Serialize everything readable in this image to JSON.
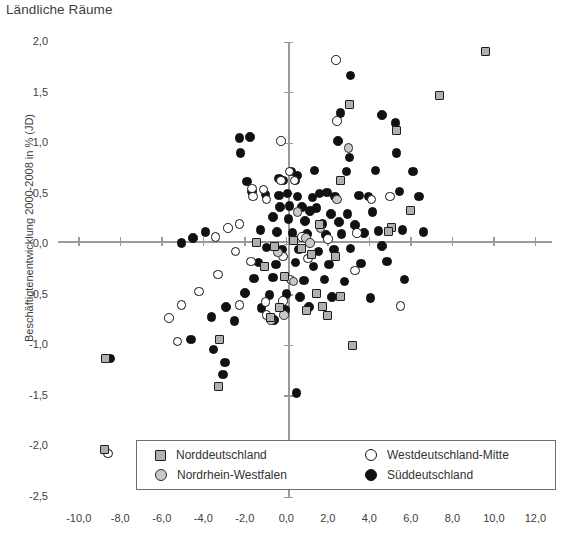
{
  "chart_data": {
    "type": "scatter",
    "title": "Ländliche Räume",
    "xlabel": "",
    "ylabel": "Beschäftigtenentwicklung 2000-2008 in % (JD)",
    "xlim": [
      -11.0,
      12.8
    ],
    "ylim": [
      -2.5,
      2.0
    ],
    "xticks": [
      "-10,0",
      "-8,0",
      "-6,0",
      "-4,0",
      "-2,0",
      "0,0",
      "2,0",
      "4,0",
      "6,0",
      "8,0",
      "10,0",
      "12,0"
    ],
    "xtick_values": [
      -10,
      -8,
      -6,
      -4,
      -2,
      0,
      2,
      4,
      6,
      8,
      10,
      12
    ],
    "yticks": [
      "2,0",
      "1,5",
      "1,0",
      "0,5",
      "0,0",
      "-0,5",
      "-1,0",
      "-1,5",
      "-2,0",
      "-2,5"
    ],
    "ytick_values": [
      2.0,
      1.5,
      1.0,
      0.5,
      0.0,
      -0.5,
      -1.0,
      -1.5,
      -2.0,
      -2.5
    ],
    "grid": false,
    "legend_position": "bottom-center",
    "series": [
      {
        "name": "Norddeutschland",
        "marker": "square",
        "color": "#b0b0b0",
        "edge_color": "#1d1d1d",
        "points": [
          [
            9.6,
            1.91
          ],
          [
            7.4,
            1.47
          ],
          [
            3.05,
            1.38
          ],
          [
            5.3,
            1.12
          ],
          [
            6.0,
            0.33
          ],
          [
            2.6,
            0.63
          ],
          [
            1.6,
            0.2
          ],
          [
            5.05,
            0.17
          ],
          [
            4.9,
            0.13
          ],
          [
            0.35,
            0.04
          ],
          [
            -1.45,
            0.02
          ],
          [
            -0.55,
            -0.02
          ],
          [
            0.75,
            -0.04
          ],
          [
            1.2,
            -0.1
          ],
          [
            2.35,
            -0.12
          ],
          [
            -1.05,
            -0.22
          ],
          [
            -0.1,
            -0.32
          ],
          [
            1.45,
            -0.49
          ],
          [
            2.6,
            -0.52
          ],
          [
            -0.35,
            -0.63
          ],
          [
            0.95,
            -0.66
          ],
          [
            2.0,
            -0.7
          ],
          [
            1.75,
            -0.62
          ],
          [
            -0.75,
            -0.72
          ],
          [
            -3.2,
            -0.94
          ],
          [
            -8.7,
            -1.13
          ],
          [
            -3.25,
            -1.41
          ],
          [
            3.2,
            -1.0
          ],
          [
            -8.75,
            -2.03
          ]
        ]
      },
      {
        "name": "Nordrhein-Westfalen",
        "marker": "circle-gray",
        "color": "#c9c9c9",
        "edge_color": "#2a2a2a",
        "points": [
          [
            2.45,
            0.44
          ],
          [
            0.55,
            0.32
          ],
          [
            1.65,
            0.16
          ],
          [
            0.95,
            0.06
          ],
          [
            1.15,
            0.01
          ],
          [
            -0.4,
            -0.08
          ],
          [
            3.0,
            0.95
          ],
          [
            -0.1,
            -0.7
          ],
          [
            -0.75,
            -0.75
          ],
          [
            0.35,
            -0.37
          ]
        ]
      },
      {
        "name": "Westdeutschland-Mitte",
        "marker": "circle-open",
        "color": "#ffffff",
        "edge_color": "#111111",
        "points": [
          [
            2.4,
            1.82
          ],
          [
            2.45,
            1.22
          ],
          [
            -0.25,
            1.02
          ],
          [
            -1.65,
            0.55
          ],
          [
            -1.1,
            0.54
          ],
          [
            -1.6,
            0.47
          ],
          [
            -0.95,
            0.44
          ],
          [
            0.15,
            0.72
          ],
          [
            0.4,
            0.63
          ],
          [
            -0.25,
            0.63
          ],
          [
            -2.25,
            0.2
          ],
          [
            -2.8,
            0.16
          ],
          [
            -3.4,
            0.07
          ],
          [
            3.4,
            0.11
          ],
          [
            2.0,
            0.05
          ],
          [
            0.75,
            0.07
          ],
          [
            4.1,
            0.44
          ],
          [
            5.0,
            0.47
          ],
          [
            -0.15,
            -0.12
          ],
          [
            -2.45,
            -0.07
          ],
          [
            -1.7,
            -0.17
          ],
          [
            1.05,
            -0.14
          ],
          [
            3.3,
            -0.26
          ],
          [
            0.2,
            -0.35
          ],
          [
            -3.3,
            -0.3
          ],
          [
            -4.2,
            -0.47
          ],
          [
            -5.05,
            -0.6
          ],
          [
            -5.65,
            -0.73
          ],
          [
            -2.25,
            -0.6
          ],
          [
            -1.0,
            -0.57
          ],
          [
            -0.15,
            -0.56
          ],
          [
            5.5,
            -0.61
          ],
          [
            -5.25,
            -0.96
          ],
          [
            -8.6,
            -2.07
          ],
          [
            -0.95,
            -0.7
          ]
        ]
      },
      {
        "name": "Süddeutschland",
        "marker": "circle-black",
        "color": "#111111",
        "edge_color": "#111111",
        "points": [
          [
            3.1,
            1.67
          ],
          [
            4.6,
            1.28
          ],
          [
            2.6,
            1.3
          ],
          [
            -2.25,
            1.05
          ],
          [
            -1.75,
            1.06
          ],
          [
            -2.2,
            0.9
          ],
          [
            2.5,
            1.02
          ],
          [
            3.05,
            0.86
          ],
          [
            5.25,
            1.2
          ],
          [
            5.3,
            0.9
          ],
          [
            4.3,
            0.73
          ],
          [
            -1.9,
            0.62
          ],
          [
            -1.65,
            0.52
          ],
          [
            -1.0,
            0.49
          ],
          [
            -0.35,
            0.65
          ],
          [
            -0.15,
            0.63
          ],
          [
            0.25,
            0.72
          ],
          [
            0.55,
            0.68
          ],
          [
            0.45,
            0.63
          ],
          [
            1.35,
            0.73
          ],
          [
            2.9,
            0.72
          ],
          [
            6.1,
            0.72
          ],
          [
            6.4,
            0.47
          ],
          [
            -0.35,
            0.48
          ],
          [
            0.05,
            0.5
          ],
          [
            0.55,
            0.47
          ],
          [
            1.25,
            0.46
          ],
          [
            1.6,
            0.5
          ],
          [
            1.95,
            0.51
          ],
          [
            2.35,
            0.47
          ],
          [
            3.5,
            0.48
          ],
          [
            3.95,
            0.47
          ],
          [
            5.45,
            0.52
          ],
          [
            -0.3,
            0.37
          ],
          [
            0.15,
            0.38
          ],
          [
            0.75,
            0.37
          ],
          [
            1.45,
            0.36
          ],
          [
            1.15,
            0.33
          ],
          [
            2.15,
            0.3
          ],
          [
            2.95,
            0.3
          ],
          [
            4.15,
            0.32
          ],
          [
            -0.65,
            0.27
          ],
          [
            0.1,
            0.25
          ],
          [
            0.9,
            0.23
          ],
          [
            1.75,
            0.2
          ],
          [
            2.55,
            0.22
          ],
          [
            3.3,
            0.19
          ],
          [
            -4.5,
            0.06
          ],
          [
            -3.9,
            0.12
          ],
          [
            -5.05,
            0.01
          ],
          [
            -1.25,
            0.14
          ],
          [
            -0.45,
            0.12
          ],
          [
            0.3,
            0.11
          ],
          [
            1.0,
            0.1
          ],
          [
            1.9,
            0.09
          ],
          [
            2.65,
            0.1
          ],
          [
            3.75,
            0.11
          ],
          [
            4.45,
            0.13
          ],
          [
            5.6,
            0.14
          ],
          [
            6.6,
            0.12
          ],
          [
            -0.95,
            -0.03
          ],
          [
            -0.2,
            -0.05
          ],
          [
            0.6,
            -0.05
          ],
          [
            1.55,
            -0.07
          ],
          [
            2.3,
            -0.05
          ],
          [
            3.1,
            -0.04
          ],
          [
            4.6,
            -0.02
          ],
          [
            -1.35,
            -0.18
          ],
          [
            -0.5,
            -0.2
          ],
          [
            0.45,
            -0.18
          ],
          [
            1.3,
            -0.22
          ],
          [
            2.05,
            -0.2
          ],
          [
            3.6,
            -0.19
          ],
          [
            4.85,
            -0.17
          ],
          [
            -1.55,
            -0.34
          ],
          [
            -0.65,
            -0.33
          ],
          [
            0.85,
            -0.36
          ],
          [
            1.85,
            -0.35
          ],
          [
            2.8,
            -0.37
          ],
          [
            5.7,
            -0.35
          ],
          [
            -2.0,
            -0.48
          ],
          [
            -0.8,
            -0.5
          ],
          [
            0.0,
            -0.49
          ],
          [
            0.65,
            -0.52
          ],
          [
            2.2,
            -0.52
          ],
          [
            4.05,
            -0.53
          ],
          [
            -2.9,
            -0.62
          ],
          [
            -1.2,
            -0.63
          ],
          [
            -0.05,
            -0.65
          ],
          [
            1.1,
            -0.62
          ],
          [
            -3.6,
            -0.72
          ],
          [
            -2.5,
            -0.76
          ],
          [
            -0.6,
            -0.75
          ],
          [
            -4.6,
            -0.94
          ],
          [
            -8.5,
            -1.13
          ],
          [
            -3.5,
            -1.04
          ],
          [
            -2.95,
            -1.17
          ],
          [
            -3.05,
            -1.29
          ],
          [
            0.5,
            -1.47
          ]
        ]
      }
    ]
  },
  "legend": {
    "items": [
      {
        "label": "Norddeutschland",
        "marker": "square"
      },
      {
        "label": "Nordrhein-Westfalen",
        "marker": "circle-gray"
      },
      {
        "label": "Westdeutschland-Mitte",
        "marker": "circle-open"
      },
      {
        "label": "Süddeutschland",
        "marker": "circle-black"
      }
    ]
  }
}
